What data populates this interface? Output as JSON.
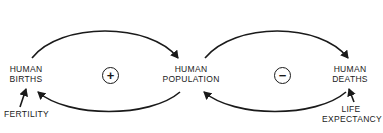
{
  "diagram": {
    "type": "causal-loop-diagram",
    "nodes": {
      "human_births": {
        "line1": "HUMAN",
        "line2": "BIRTHS"
      },
      "human_population": {
        "line1": "HUMAN",
        "line2": "POPULATION"
      },
      "human_deaths": {
        "line1": "HUMAN",
        "line2": "DEATHS"
      },
      "fertility": {
        "line1": "FERTILITY"
      },
      "life_expectancy": {
        "line1": "LIFE",
        "line2": "EXPECTANCY"
      }
    },
    "loops": [
      {
        "id": "births-loop",
        "polarity": "+",
        "type": "reinforcing",
        "between": [
          "human_births",
          "human_population"
        ]
      },
      {
        "id": "deaths-loop",
        "polarity": "−",
        "type": "balancing",
        "between": [
          "human_population",
          "human_deaths"
        ]
      }
    ],
    "links": [
      {
        "from": "human_births",
        "to": "human_population"
      },
      {
        "from": "human_population",
        "to": "human_births"
      },
      {
        "from": "human_population",
        "to": "human_deaths"
      },
      {
        "from": "human_deaths",
        "to": "human_population"
      },
      {
        "from": "fertility",
        "to": "human_births"
      },
      {
        "from": "life_expectancy",
        "to": "human_deaths"
      }
    ],
    "colors": {
      "ink": "#1a1a1a",
      "background": "#ffffff"
    }
  }
}
